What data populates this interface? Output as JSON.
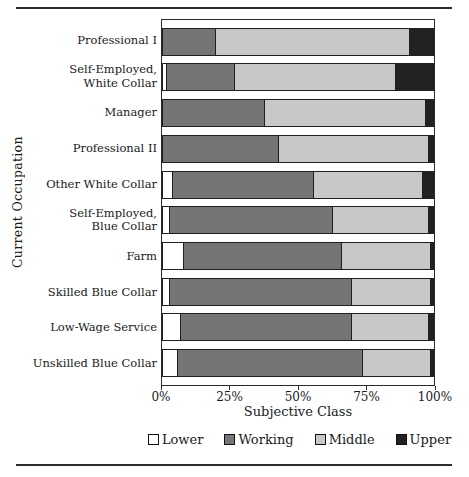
{
  "chart_data": {
    "type": "bar",
    "orientation": "horizontal",
    "stacked": true,
    "title": "",
    "xlabel": "Subjective Class",
    "ylabel": "Current Occupation",
    "xlim": [
      0,
      100
    ],
    "grid": false,
    "legend_position": "bottom",
    "x_ticks": [
      {
        "value": 0,
        "label": "0%"
      },
      {
        "value": 25,
        "label": "25%"
      },
      {
        "value": 50,
        "label": "50%"
      },
      {
        "value": 75,
        "label": "75%"
      },
      {
        "value": 100,
        "label": "100%"
      }
    ],
    "categories": [
      "Professional I",
      "Self-Employed,\nWhite Collar",
      "Manager",
      "Professional II",
      "Other White Collar",
      "Self-Employed,\nBlue Collar",
      "Farm",
      "Skilled Blue Collar",
      "Low-Wage Service",
      "Unskilled Blue Collar"
    ],
    "series": [
      {
        "name": "Lower",
        "color": "#ffffff",
        "values": [
          0,
          2,
          0,
          0,
          4,
          3,
          8,
          3,
          7,
          6
        ]
      },
      {
        "name": "Working",
        "color": "#757575",
        "values": [
          20,
          25,
          38,
          43,
          52,
          60,
          58,
          67,
          63,
          68
        ]
      },
      {
        "name": "Middle",
        "color": "#c8c8c8",
        "values": [
          71,
          59,
          59,
          55,
          40,
          35,
          33,
          29,
          28,
          25
        ]
      },
      {
        "name": "Upper",
        "color": "#222222",
        "values": [
          9,
          14,
          3,
          2,
          4,
          2,
          1,
          1,
          2,
          1
        ]
      }
    ],
    "colors": {
      "frame": "#2a2a2a",
      "segment_border": "#1f1f1f",
      "rule": "#2e2e2e",
      "background": "#ffffff"
    }
  }
}
